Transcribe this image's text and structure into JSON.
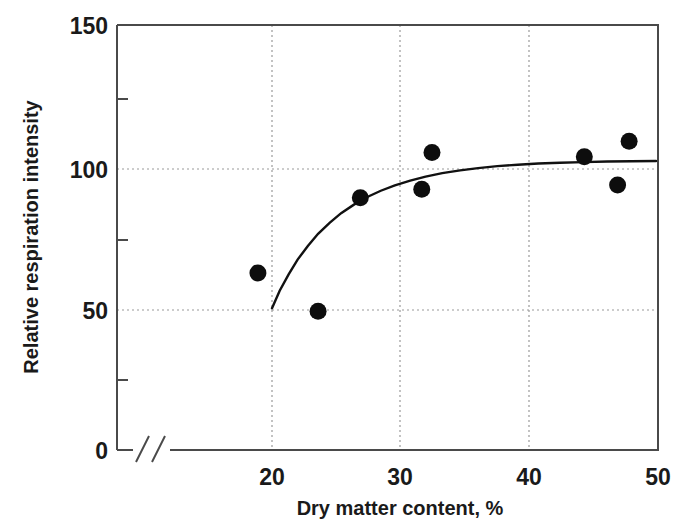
{
  "chart_data": {
    "type": "scatter",
    "title": "",
    "xlabel": "Dry matter content, %",
    "ylabel": "Relative respiration intensity",
    "xlim": [
      15.8,
      50
    ],
    "ylim": [
      0,
      150
    ],
    "axis_break_x": true,
    "grid": true,
    "legend": null,
    "x_ticks": [
      20,
      30,
      40,
      50
    ],
    "x_tick_labels": [
      "20",
      "30",
      "40",
      "50"
    ],
    "y_ticks": [
      0,
      50,
      100,
      150
    ],
    "y_tick_labels": [
      "0",
      "50",
      "100",
      "150"
    ],
    "y_minor_ticks": [
      25,
      75,
      125
    ],
    "points": [
      {
        "x": 18.9,
        "y": 62.5
      },
      {
        "x": 23.6,
        "y": 49
      },
      {
        "x": 26.9,
        "y": 89
      },
      {
        "x": 31.7,
        "y": 92
      },
      {
        "x": 32.5,
        "y": 105
      },
      {
        "x": 44.4,
        "y": 103.5
      },
      {
        "x": 47.0,
        "y": 93.5
      },
      {
        "x": 47.9,
        "y": 109
      }
    ],
    "series": [
      {
        "name": "fitted curve",
        "type": "line",
        "x": [
          20.0,
          20.6,
          21.3,
          22.0,
          22.8,
          23.6,
          24.5,
          25.4,
          26.4,
          27.4,
          28.5,
          29.6,
          30.8,
          32.0,
          33.3,
          34.7,
          36.1,
          37.6,
          39.2,
          40.8,
          42.5,
          44.3,
          46.2,
          48.1,
          50.0
        ],
        "y": [
          50.0,
          56.2,
          62.0,
          67.2,
          72.0,
          76.3,
          80.2,
          83.6,
          86.6,
          89.2,
          91.5,
          93.4,
          95.1,
          96.5,
          97.7,
          98.7,
          99.5,
          100.2,
          100.7,
          101.1,
          101.4,
          101.6,
          101.8,
          101.9,
          102.0
        ]
      }
    ]
  },
  "axes": {
    "x_title": "Dry matter content, %",
    "y_title": "Relative respiration intensity",
    "x_labels": [
      "20",
      "30",
      "40",
      "50"
    ],
    "y_labels": [
      "150",
      "100",
      "50",
      "0"
    ]
  },
  "colors": {
    "point": "#0d0d0d",
    "curve": "#111111",
    "frame": "#4a4a4a",
    "grid": "#9a9a9a",
    "text": "#1a1a1a",
    "background": "#ffffff"
  }
}
